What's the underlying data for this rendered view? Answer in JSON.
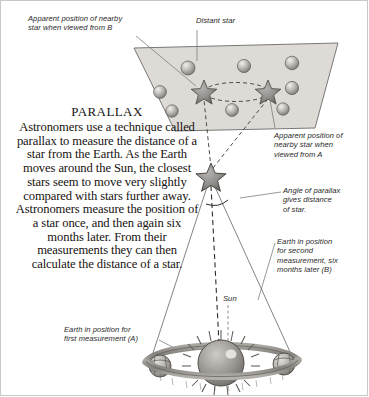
{
  "diagram": {
    "title": "Parallax",
    "body": "Astronomers use a technique called parallax to measure the distance of a star from the Earth. As the Earth moves around the Sun, the closest stars seem to move very slightly compared with stars further away. Astronomers measure the position of a star once, and then again six months later. From their measurements they can then calculate the distance of a star."
  },
  "labels": {
    "apparent_b": "Apparent position of nearby\nstar when viewed from B",
    "distant_star": "Distant star",
    "apparent_a": "Apparent position of\nnearby star when\nviewed from A",
    "angle_of_parallax": "Angle of parallax\ngives distance\nof star.",
    "second_measurement": "Earth in position\nfor second\nmeasurement, six\nmonths later (B)",
    "first_measurement": "Earth in position for\nfirst measurement (A)",
    "sun": "Sun"
  },
  "colors": {
    "page_background": "#ffffff",
    "starfield_fill": "#dedad6",
    "starfield_stroke": "#6b6b6b",
    "star_body": "#8d8a87",
    "star_outline": "#4a4845",
    "distant_star_fill": "#b9b5b1",
    "leader_line": "#7d7d7d",
    "sight_line": "#6e6e6e",
    "text": "#17120f",
    "label_text": "#2a2a2a",
    "sun_core": "#9c9894",
    "orbit_ring": "#8e8a86",
    "earth_globe": "#b3afab"
  },
  "starfield": {
    "distant_stars": [
      {
        "cx": 188,
        "cy": 68,
        "r": 7.0
      },
      {
        "cx": 244,
        "cy": 66,
        "r": 6.6
      },
      {
        "cx": 292,
        "cy": 63,
        "r": 6.8
      },
      {
        "cx": 160,
        "cy": 92,
        "r": 6.4
      },
      {
        "cx": 292,
        "cy": 88,
        "r": 6.6
      },
      {
        "cx": 172,
        "cy": 111,
        "r": 6.2
      },
      {
        "cx": 232,
        "cy": 110,
        "r": 6.4
      },
      {
        "cx": 283,
        "cy": 109,
        "r": 6.2
      }
    ],
    "nearby_star_positions": [
      {
        "name": "viewed-from-B",
        "cx": 204,
        "cy": 92,
        "r": 11.5
      },
      {
        "name": "viewed-from-A",
        "cx": 268,
        "cy": 92,
        "r": 11.5
      }
    ],
    "apparent_motion_ellipse": {
      "cx": 236,
      "cy": 92,
      "rx": 32,
      "ry": 9.5
    }
  },
  "geometry": {
    "nearby_star": {
      "cx": 211,
      "cy": 177,
      "r": 13.5
    },
    "sun": {
      "cx": 221,
      "cy": 362,
      "r": 23
    },
    "earth_a": {
      "cx": 160,
      "cy": 366,
      "r": 11
    },
    "earth_b": {
      "cx": 284,
      "cy": 364,
      "r": 11
    }
  }
}
